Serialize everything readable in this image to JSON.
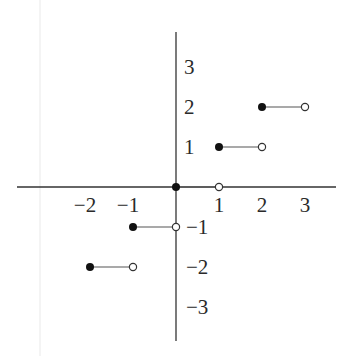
{
  "chart_data": {
    "type": "line",
    "title": "",
    "xlabel": "",
    "ylabel": "",
    "xlim": [
      -4,
      3.7
    ],
    "ylim": [
      -3.9,
      3.9
    ],
    "grid": false,
    "legend": null,
    "x_ticks": [
      {
        "value": -2,
        "label": "−2"
      },
      {
        "value": -1,
        "label": "−1"
      },
      {
        "value": 1,
        "label": "1"
      },
      {
        "value": 2,
        "label": "2"
      },
      {
        "value": 3,
        "label": "3"
      }
    ],
    "y_ticks": [
      {
        "value": 3,
        "label": "3"
      },
      {
        "value": 2,
        "label": "2"
      },
      {
        "value": 1,
        "label": "1"
      },
      {
        "value": -1,
        "label": "−1"
      },
      {
        "value": -2,
        "label": "−2"
      },
      {
        "value": -3,
        "label": "−3"
      }
    ],
    "segments": [
      {
        "x_start": -2,
        "x_end": -1,
        "y": -2,
        "start": "closed",
        "end": "open"
      },
      {
        "x_start": -1,
        "x_end": 0,
        "y": -1,
        "start": "closed",
        "end": "open"
      },
      {
        "x_start": 0,
        "x_end": 1,
        "y": 0,
        "start": "closed",
        "end": "open"
      },
      {
        "x_start": 1,
        "x_end": 2,
        "y": 1,
        "start": "closed",
        "end": "open"
      },
      {
        "x_start": 2,
        "x_end": 3,
        "y": 2,
        "start": "closed",
        "end": "open"
      }
    ],
    "colors": {
      "axis": "#333333",
      "segment": "#555555",
      "closed_dot": "#111111",
      "open_dot_stroke": "#333333",
      "open_dot_fill": "#ffffff"
    }
  }
}
